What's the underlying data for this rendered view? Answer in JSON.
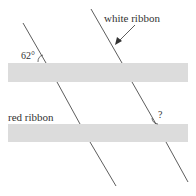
{
  "diagram": {
    "labels": {
      "white_ribbon": "white ribbon",
      "red_ribbon": "red ribbon",
      "angle_given": "62°",
      "angle_unknown": "?"
    },
    "colors": {
      "ribbon_fill": "#dcdcdc",
      "line": "#333333"
    }
  }
}
